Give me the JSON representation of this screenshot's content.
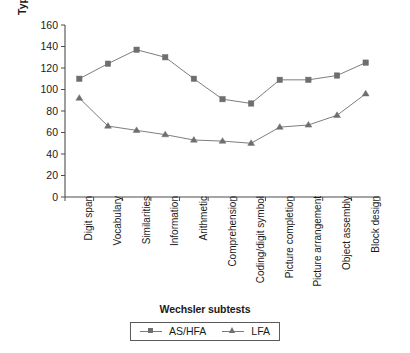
{
  "chart_data": {
    "type": "line",
    "title": "",
    "xlabel": "Wechsler subtests",
    "ylabel": "Typical quotients (mean=100)",
    "ylim": [
      0,
      160
    ],
    "yticks": [
      0,
      20,
      40,
      60,
      80,
      100,
      120,
      140,
      160
    ],
    "grid": false,
    "legend_position": "bottom",
    "categories": [
      "Digit span",
      "Vocabulary",
      "Similarities",
      "Information",
      "Arithmetic",
      "Comprehension",
      "Coding/digit symbol",
      "Picture completion",
      "Picture arrangement",
      "Object assembly",
      "Block design"
    ],
    "series": [
      {
        "name": "AS/HFA",
        "marker": "square",
        "color": "#6e6e6e",
        "values": [
          110,
          124,
          137,
          130,
          110,
          91,
          87,
          109,
          109,
          113,
          125
        ]
      },
      {
        "name": "LFA",
        "marker": "triangle",
        "color": "#6e6e6e",
        "values": [
          92,
          66,
          62,
          58,
          53,
          52,
          50,
          65,
          67,
          76,
          96
        ]
      }
    ]
  },
  "axis": {
    "line_color": "#4d4d4d"
  }
}
